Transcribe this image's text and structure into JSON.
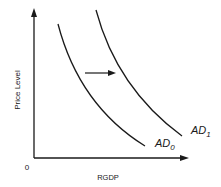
{
  "diagram": {
    "title": "",
    "y_axis": {
      "label": "Price Level"
    },
    "x_axis": {
      "label": "RGDP",
      "origin_label": "0"
    },
    "curves": [
      {
        "name": "AD0",
        "base": "AD",
        "subscript": "0"
      },
      {
        "name": "AD1",
        "base": "AD",
        "subscript": "1"
      }
    ],
    "shift_arrow": {
      "direction": "right",
      "meaning": "AD shifts from AD0 to AD1"
    },
    "colors": {
      "line": "#1a1a1a",
      "background": "#ffffff"
    }
  }
}
